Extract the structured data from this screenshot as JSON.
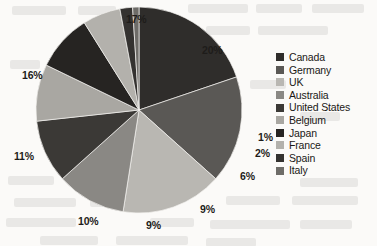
{
  "chart_data": {
    "type": "pie",
    "title": "",
    "categories": [
      "Canada",
      "Germany",
      "UK",
      "Australia",
      "United States",
      "Belgium",
      "Japan",
      "France",
      "Spain",
      "Italy"
    ],
    "values": [
      20,
      17,
      16,
      11,
      10,
      9,
      9,
      6,
      2,
      1
    ],
    "value_labels": [
      "20%",
      "17%",
      "16%",
      "11%",
      "10%",
      "9%",
      "9%",
      "6%",
      "2%",
      "1%"
    ],
    "colors": [
      "#2f2d2b",
      "#5a5855",
      "#b9b7b2",
      "#8a8884",
      "#3b3936",
      "#a9a7a2",
      "#262422",
      "#b3b1ac",
      "#343230",
      "#6e6c68"
    ],
    "legend_position": "right",
    "grid": false,
    "start_angle_deg": 0,
    "direction": "clockwise"
  },
  "legend": {
    "items": [
      {
        "label": "Canada",
        "color": "#2f2d2b"
      },
      {
        "label": "Germany",
        "color": "#5a5855"
      },
      {
        "label": "UK",
        "color": "#b9b7b2"
      },
      {
        "label": "Australia",
        "color": "#8a8884"
      },
      {
        "label": "United States",
        "color": "#3b3936"
      },
      {
        "label": "Belgium",
        "color": "#a9a7a2"
      },
      {
        "label": "Japan",
        "color": "#262422"
      },
      {
        "label": "France",
        "color": "#b3b1ac"
      },
      {
        "label": "Spain",
        "color": "#343230"
      },
      {
        "label": "Italy",
        "color": "#6e6c68"
      }
    ]
  },
  "labels": {
    "canada": "20%",
    "germany": "17%",
    "uk": "16%",
    "australia": "11%",
    "united_states": "10%",
    "belgium": "9%",
    "japan": "9%",
    "france": "6%",
    "spain": "2%",
    "italy": "1%"
  }
}
